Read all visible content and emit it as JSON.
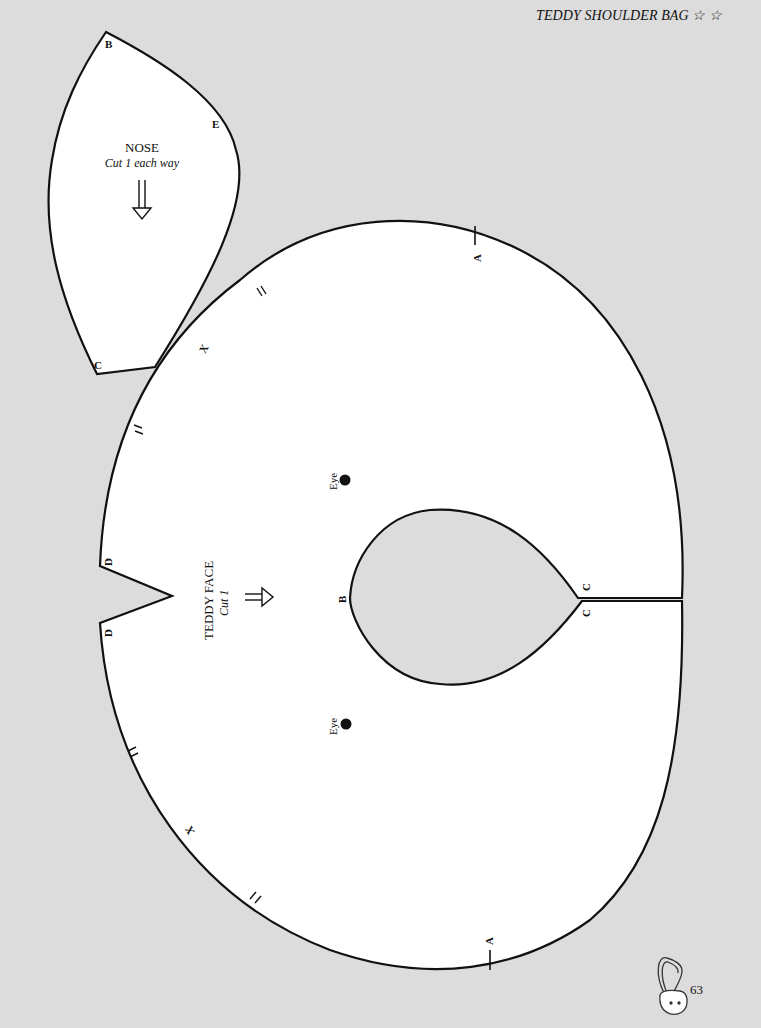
{
  "header": {
    "title": "TEDDY SHOULDER BAG",
    "rating": "☆ ☆"
  },
  "footer": {
    "page_number": "63",
    "icon": "teddy-bag-icon"
  },
  "colors": {
    "background": "#dcdcdc",
    "pattern_fill": "#ffffff",
    "outline": "#111111"
  },
  "nose_piece": {
    "title": "NOSE",
    "instruction": "Cut 1 each way",
    "grain_arrow": "down",
    "points": {
      "B": "B",
      "E": "E",
      "C": "C"
    }
  },
  "face_piece": {
    "title": "TEDDY FACE",
    "instruction": "Cut 1",
    "grain_arrow": "right",
    "eye_label": "Eye",
    "points": {
      "A": "A",
      "B": "B",
      "C": "C",
      "D": "D",
      "X": "X"
    }
  }
}
